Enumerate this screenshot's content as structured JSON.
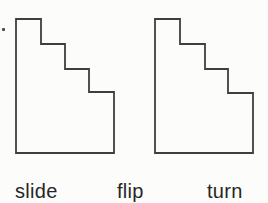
{
  "labels": {
    "slide": "slide",
    "flip": "flip",
    "turn": "turn"
  },
  "colors": {
    "outline": "#3f3f3f",
    "text": "#262626",
    "background": "#fcfcfa",
    "marker": "#4a4a4a"
  }
}
